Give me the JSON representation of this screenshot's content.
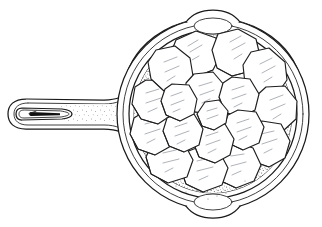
{
  "artwork": {
    "title": "Cast iron skillet with sliced potatoes",
    "subject": "skillet",
    "style": "black-and-white line drawing with stipple shading",
    "background_color": "#ffffff",
    "line_color": "#1a1a1a",
    "hatch_color": "#9aa0a6",
    "stipple_color": "#3a3a3a"
  },
  "pan": {
    "label": "skillet body",
    "shape": "circle",
    "center": {
      "x": 213,
      "y": 114
    },
    "outer_radius": 96,
    "rim_radius": 88,
    "wall_radius": 80,
    "interior_radius": 70,
    "rings": [
      96,
      90,
      84,
      78,
      71
    ],
    "spouts": [
      {
        "label": "top pour spout",
        "angle_deg": -90
      },
      {
        "label": "bottom pour spout",
        "angle_deg": 90
      }
    ]
  },
  "handle": {
    "label": "skillet handle",
    "tip_x": 12,
    "tip_y": 114,
    "join_x": 128,
    "join_y": 114,
    "half_width": 13,
    "hang_hole": {
      "label": "hanging hole",
      "cx": 45,
      "cy": 114,
      "rx": 28,
      "ry": 9
    }
  },
  "stipple_band": {
    "label": "shaded interior band",
    "inner_radius": 64,
    "outer_radius": 79,
    "density": "medium"
  },
  "slices": {
    "label": "potato slices",
    "count": 19,
    "outer_ring_count": 12,
    "inner_ring_count": 6,
    "center_count": 1,
    "items": [
      {
        "id": 1,
        "cx": 196,
        "cy": 53,
        "r": 24,
        "rot": 12,
        "sides": 8
      },
      {
        "id": 2,
        "cx": 236,
        "cy": 52,
        "r": 23,
        "rot": -18,
        "sides": 8
      },
      {
        "id": 3,
        "cx": 266,
        "cy": 73,
        "r": 25,
        "rot": 30,
        "sides": 7
      },
      {
        "id": 4,
        "cx": 275,
        "cy": 108,
        "r": 24,
        "rot": 8,
        "sides": 8
      },
      {
        "id": 5,
        "cx": 266,
        "cy": 142,
        "r": 24,
        "rot": -24,
        "sides": 7
      },
      {
        "id": 6,
        "cx": 238,
        "cy": 164,
        "r": 24,
        "rot": 16,
        "sides": 8
      },
      {
        "id": 7,
        "cx": 203,
        "cy": 170,
        "r": 23,
        "rot": -10,
        "sides": 8
      },
      {
        "id": 8,
        "cx": 169,
        "cy": 161,
        "r": 23,
        "rot": 24,
        "sides": 7
      },
      {
        "id": 9,
        "cx": 150,
        "cy": 132,
        "r": 22,
        "rot": -6,
        "sides": 8
      },
      {
        "id": 10,
        "cx": 149,
        "cy": 100,
        "r": 22,
        "rot": 18,
        "sides": 8
      },
      {
        "id": 11,
        "cx": 160,
        "cy": 70,
        "r": 23,
        "rot": -20,
        "sides": 7
      },
      {
        "id": 12,
        "cx": 183,
        "cy": 48,
        "r": 21,
        "rot": 6,
        "sides": 8
      },
      {
        "id": 13,
        "cx": 206,
        "cy": 92,
        "r": 22,
        "rot": 14,
        "sides": 8
      },
      {
        "id": 14,
        "cx": 241,
        "cy": 96,
        "r": 21,
        "rot": -14,
        "sides": 7
      },
      {
        "id": 15,
        "cx": 246,
        "cy": 128,
        "r": 21,
        "rot": 22,
        "sides": 8
      },
      {
        "id": 16,
        "cx": 216,
        "cy": 141,
        "r": 21,
        "rot": -8,
        "sides": 8
      },
      {
        "id": 17,
        "cx": 185,
        "cy": 131,
        "r": 21,
        "rot": 10,
        "sides": 7
      },
      {
        "id": 18,
        "cx": 180,
        "cy": 100,
        "r": 20,
        "rot": -22,
        "sides": 8
      },
      {
        "id": 19,
        "cx": 214,
        "cy": 114,
        "r": 16,
        "rot": 5,
        "sides": 7
      }
    ]
  }
}
